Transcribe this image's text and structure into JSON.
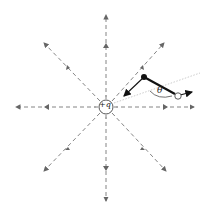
{
  "diagram": {
    "charge_label": "+q",
    "angle_label": "θ",
    "colors": {
      "field_line": "#777777",
      "dipole": "#111111",
      "axis_faint": "#cccccc"
    },
    "field_lines": 8,
    "dipole": {
      "negative_end": "filled dot",
      "positive_end": "open circle"
    }
  }
}
